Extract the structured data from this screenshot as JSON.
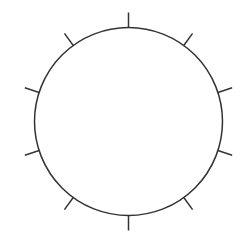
{
  "diagram": {
    "type": "circle-with-radial-ticks",
    "background": "#ffffff",
    "stroke_color": "#333333",
    "circle": {
      "cx": 128.5,
      "cy": 121.5,
      "r": 94,
      "stroke_width": 1.5
    },
    "ticks": {
      "count": 10,
      "start_angle_deg": 0,
      "step_deg": 36,
      "length": 15,
      "stroke_width": 1.5
    }
  }
}
